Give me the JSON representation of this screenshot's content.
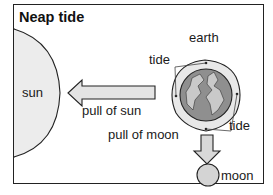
{
  "title": "Neap tide",
  "labels": {
    "sun": "sun",
    "earth": "earth",
    "tide_top": "tide",
    "tide_bottom": "tide",
    "pull_of_sun": "pull of sun",
    "pull_of_moon": "pull of moon",
    "moon": "moon"
  },
  "colors": {
    "sun_fill": "#ececec",
    "arrow_fill": "#e4e4e4",
    "earth_ocean": "#8f8f8f",
    "earth_land": "#c9c9c9",
    "tide_bulge": "#e8e8e8",
    "moon_fill": "#d4d4d4",
    "stroke": "#222222"
  }
}
